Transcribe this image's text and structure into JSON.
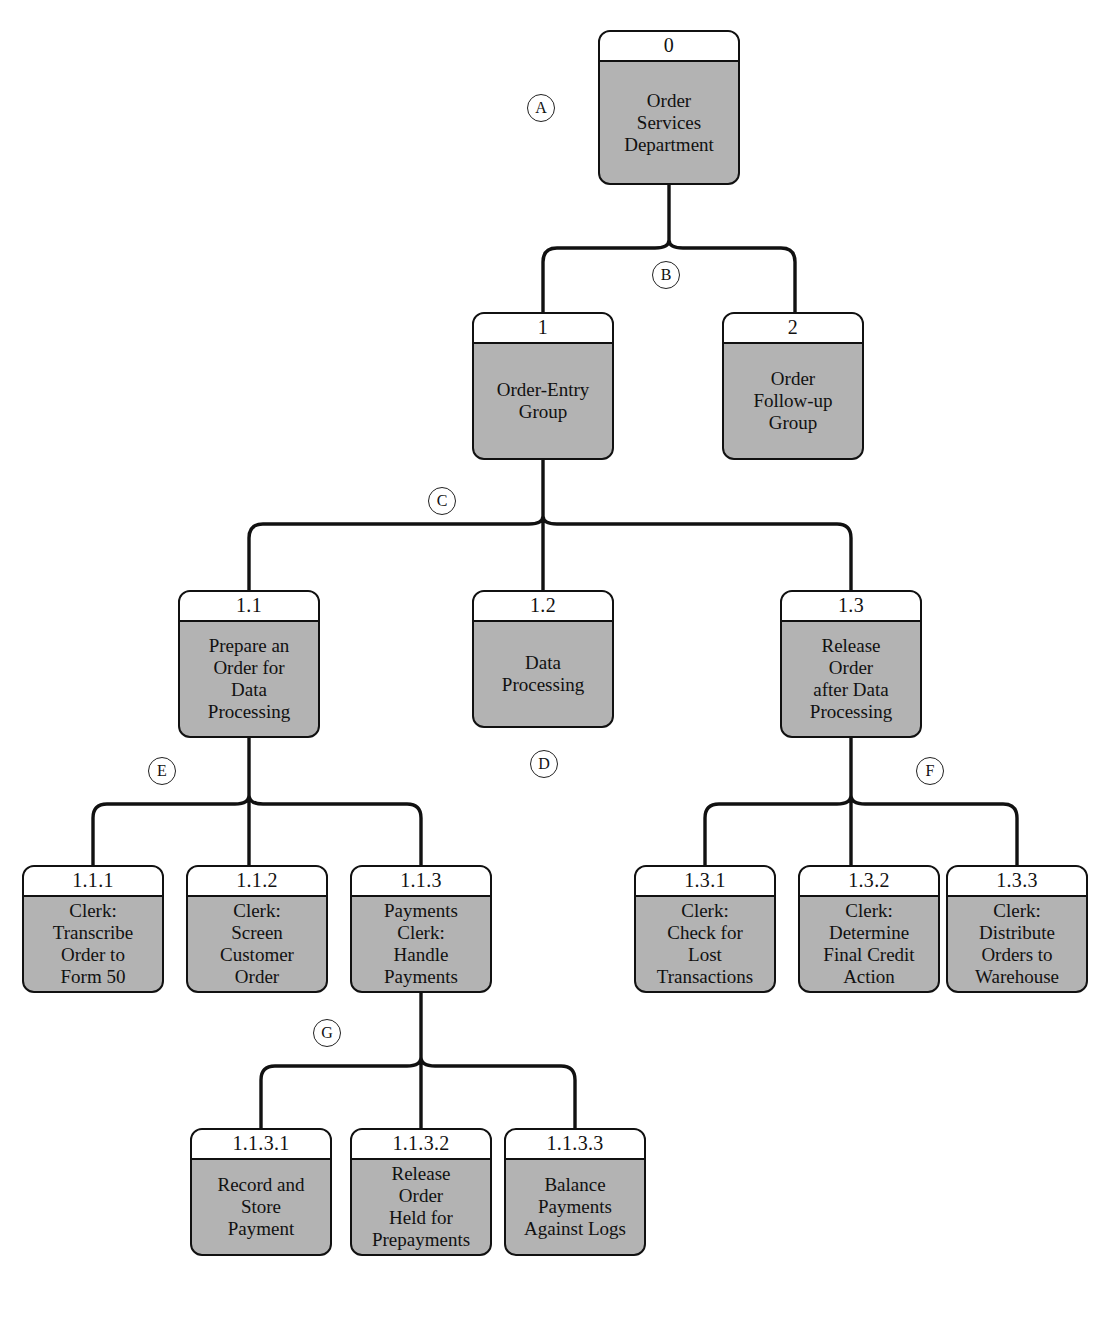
{
  "diagram": {
    "style": {
      "node_fill": "#b3b3b3",
      "node_header_fill": "#ffffff",
      "stroke": "#111111",
      "background": "#ffffff"
    },
    "nodes": [
      {
        "key": "n0",
        "id": "0",
        "label": "Order\nServices\nDepartment",
        "x": 598,
        "y": 30,
        "w": 142,
        "h": 155
      },
      {
        "key": "n1",
        "id": "1",
        "label": "Order-Entry\nGroup",
        "x": 472,
        "y": 312,
        "w": 142,
        "h": 148
      },
      {
        "key": "n2",
        "id": "2",
        "label": "Order\nFollow-up\nGroup",
        "x": 722,
        "y": 312,
        "w": 142,
        "h": 148
      },
      {
        "key": "n11",
        "id": "1.1",
        "label": "Prepare an\nOrder for\nData\nProcessing",
        "x": 178,
        "y": 590,
        "w": 142,
        "h": 148
      },
      {
        "key": "n12",
        "id": "1.2",
        "label": "Data\nProcessing",
        "x": 472,
        "y": 590,
        "w": 142,
        "h": 138
      },
      {
        "key": "n13",
        "id": "1.3",
        "label": "Release\nOrder\nafter Data\nProcessing",
        "x": 780,
        "y": 590,
        "w": 142,
        "h": 148
      },
      {
        "key": "n111",
        "id": "1.1.1",
        "label": "Clerk:\nTranscribe\nOrder to\nForm 50",
        "x": 22,
        "y": 865,
        "w": 142,
        "h": 128
      },
      {
        "key": "n112",
        "id": "1.1.2",
        "label": "Clerk:\nScreen\nCustomer\nOrder",
        "x": 186,
        "y": 865,
        "w": 142,
        "h": 128
      },
      {
        "key": "n113",
        "id": "1.1.3",
        "label": "Payments\nClerk:\nHandle\nPayments",
        "x": 350,
        "y": 865,
        "w": 142,
        "h": 128
      },
      {
        "key": "n131",
        "id": "1.3.1",
        "label": "Clerk:\nCheck for\nLost\nTransactions",
        "x": 634,
        "y": 865,
        "w": 142,
        "h": 128
      },
      {
        "key": "n132",
        "id": "1.3.2",
        "label": "Clerk:\nDetermine\nFinal Credit\nAction",
        "x": 798,
        "y": 865,
        "w": 142,
        "h": 128
      },
      {
        "key": "n133",
        "id": "1.3.3",
        "label": "Clerk:\nDistribute\nOrders to\nWarehouse",
        "x": 946,
        "y": 865,
        "w": 142,
        "h": 128
      },
      {
        "key": "n1131",
        "id": "1.1.3.1",
        "label": "Record and\nStore\nPayment",
        "x": 190,
        "y": 1128,
        "w": 142,
        "h": 128
      },
      {
        "key": "n1132",
        "id": "1.1.3.2",
        "label": "Release\nOrder\nHeld for\nPrepayments",
        "x": 350,
        "y": 1128,
        "w": 142,
        "h": 128
      },
      {
        "key": "n1133",
        "id": "1.1.3.3",
        "label": "Balance\nPayments\nAgainst Logs",
        "x": 504,
        "y": 1128,
        "w": 142,
        "h": 128
      }
    ],
    "markers": [
      {
        "key": "mA",
        "letter": "A",
        "x": 527,
        "y": 94
      },
      {
        "key": "mB",
        "letter": "B",
        "x": 652,
        "y": 261
      },
      {
        "key": "mC",
        "letter": "C",
        "x": 428,
        "y": 487
      },
      {
        "key": "mD",
        "letter": "D",
        "x": 530,
        "y": 750
      },
      {
        "key": "mE",
        "letter": "E",
        "x": 148,
        "y": 757
      },
      {
        "key": "mF",
        "letter": "F",
        "x": 916,
        "y": 757
      },
      {
        "key": "mG",
        "letter": "G",
        "x": 313,
        "y": 1019
      }
    ],
    "connectors": [
      {
        "key": "c-root",
        "name": "connector-root-to-groups",
        "from": "0",
        "to": [
          "1",
          "2"
        ]
      },
      {
        "key": "c-g1",
        "name": "connector-group1-to-tasks",
        "from": "1",
        "to": [
          "1.1",
          "1.2",
          "1.3"
        ]
      },
      {
        "key": "c-t11",
        "name": "connector-11-to-subtasks",
        "from": "1.1",
        "to": [
          "1.1.1",
          "1.1.2",
          "1.1.3"
        ]
      },
      {
        "key": "c-t13",
        "name": "connector-13-to-subtasks",
        "from": "1.3",
        "to": [
          "1.3.1",
          "1.3.2",
          "1.3.3"
        ]
      },
      {
        "key": "c-t113",
        "name": "connector-113-to-subtasks",
        "from": "1.1.3",
        "to": [
          "1.1.3.1",
          "1.1.3.2",
          "1.1.3.3"
        ]
      }
    ]
  }
}
